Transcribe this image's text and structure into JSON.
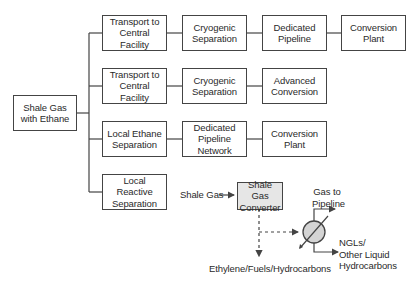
{
  "root": {
    "label": "Shale Gas\nwith Ethane"
  },
  "pathways": [
    {
      "steps": [
        "Transport to\nCentral Facility",
        "Cryogenic\nSeparation",
        "Dedicated\nPipeline",
        "Conversion\nPlant"
      ]
    },
    {
      "steps": [
        "Transport to\nCentral Facility",
        "Cryogenic\nSeparation",
        "Advanced\nConversion"
      ]
    },
    {
      "steps": [
        "Local Ethane\nSeparation",
        "Dedicated\nPipeline\nNetwork",
        "Conversion\nPlant"
      ]
    },
    {
      "steps": [
        "Local Reactive\nSeparation"
      ]
    }
  ],
  "reactive_detail": {
    "input_label": "Shale Gas",
    "converter_label": "Shale Gas\nConverter",
    "product_label": "Ethylene/Fuels/Hydrocarbons",
    "gas_output_label": "Gas to\nPipeline",
    "liquid_output_label": "NGLs/\nOther Liquid\nHydrocarbons"
  },
  "colors": {
    "line": "#444444",
    "converter_fill": "#e6e6e6",
    "separator_fill": "#d4d4d4"
  }
}
